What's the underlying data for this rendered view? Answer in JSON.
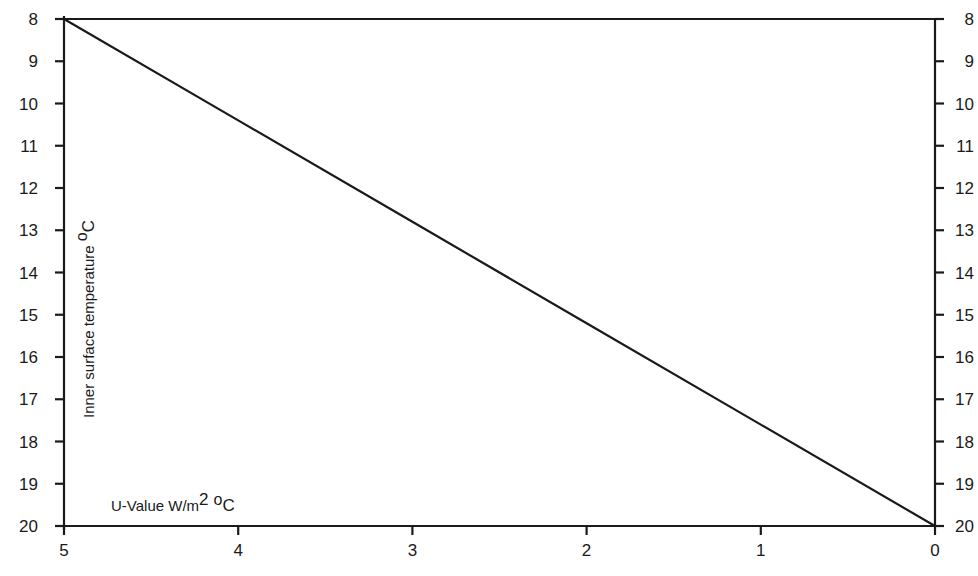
{
  "chart_data": {
    "type": "line",
    "title": "",
    "xlabel": "U-Value W/m2 oC",
    "ylabel": "Inner surface temperature oC",
    "x_ticks": [
      "5",
      "4",
      "3",
      "2",
      "1",
      "0"
    ],
    "y_ticks_left": [
      "8",
      "9",
      "10",
      "11",
      "12",
      "13",
      "14",
      "15",
      "16",
      "17",
      "18",
      "19",
      "20"
    ],
    "y_ticks_right": [
      "8",
      "9",
      "10",
      "11",
      "12",
      "13",
      "14",
      "15",
      "16",
      "17",
      "18",
      "19",
      "20"
    ],
    "xlim": [
      5,
      0
    ],
    "ylim": [
      20,
      8
    ],
    "y_inverted": true,
    "x_reversed": true,
    "grid": false,
    "legend": null,
    "series": [
      {
        "name": "Inner surface temperature vs U-Value",
        "x": [
          5,
          4,
          3,
          2,
          1,
          0
        ],
        "y": [
          8,
          10.4,
          12.8,
          15.2,
          17.6,
          20
        ]
      }
    ]
  },
  "labels": {
    "ylabel_main": "Inner surface temperature ",
    "ylabel_deg": "o",
    "ylabel_unit": "C",
    "xlabel_main": "U-Value W/m",
    "xlabel_sup": "2",
    "xlabel_deg": "o",
    "xlabel_unit": "C"
  },
  "colors": {
    "line": "#1a1a1a",
    "background": "#ffffff"
  }
}
